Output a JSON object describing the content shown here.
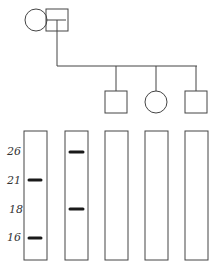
{
  "pedigree": {
    "parents": [
      {
        "id": "mother",
        "sex": "female",
        "shape": "circle"
      },
      {
        "id": "father",
        "sex": "male",
        "shape": "square"
      }
    ],
    "children": [
      {
        "id": "child1",
        "sex": "male",
        "shape": "square"
      },
      {
        "id": "child2",
        "sex": "female",
        "shape": "circle"
      },
      {
        "id": "child3",
        "sex": "male",
        "shape": "square"
      }
    ]
  },
  "gel": {
    "size_labels": [
      "26",
      "21",
      "18",
      "16"
    ],
    "lanes": [
      {
        "id": "mother",
        "bands": [
          "21",
          "16"
        ]
      },
      {
        "id": "father",
        "bands": [
          "26",
          "18"
        ]
      },
      {
        "id": "child1",
        "bands": []
      },
      {
        "id": "child2",
        "bands": []
      },
      {
        "id": "child3",
        "bands": []
      }
    ]
  },
  "colors": {
    "line": "#444444",
    "band": "#1a1a1a"
  }
}
